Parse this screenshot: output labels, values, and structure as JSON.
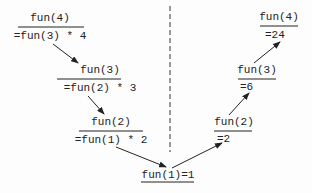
{
  "descending": [
    {
      "call": "fun(4)",
      "expr": "=fun(3) * 4"
    },
    {
      "call": "fun(3)",
      "expr": "=fun(2) * 3"
    },
    {
      "call": "fun(2)",
      "expr": "=fun(1) * 2"
    }
  ],
  "base": {
    "label": "fun(1)=1"
  },
  "ascending": [
    {
      "call": "fun(2)",
      "result": "=2"
    },
    {
      "call": "fun(3)",
      "result": "=6"
    },
    {
      "call": "fun(4)",
      "result": "=24"
    }
  ],
  "colors": {
    "ink": "#222222",
    "background": "#fdfdfd"
  }
}
